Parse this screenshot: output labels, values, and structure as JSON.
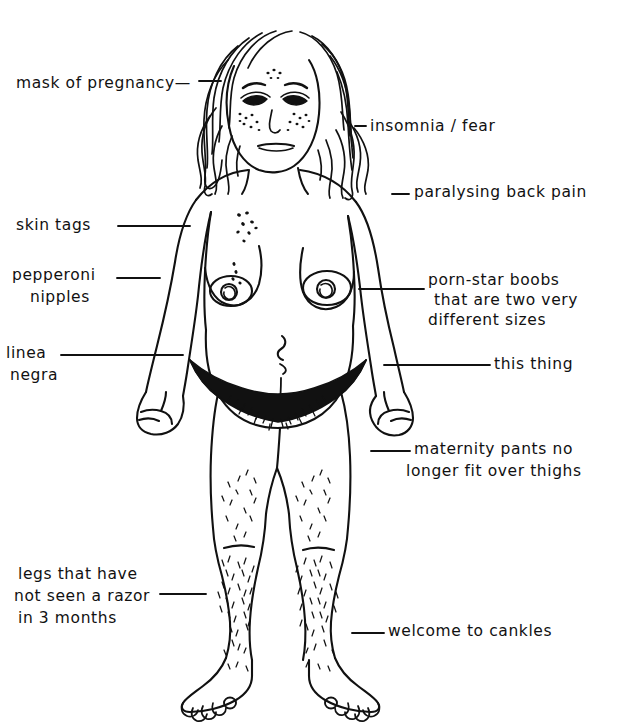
{
  "figure": {
    "style": "black ink line drawing on white background",
    "background_color": "#ffffff",
    "ink_color": "#111111"
  },
  "labels": {
    "mask_of_pregnancy": "mask of pregnancy—",
    "skin_tags": "skin tags",
    "pepperoni_nipples_line1": "pepperoni",
    "pepperoni_nipples_line2": "nipples",
    "linea_negra_line1": "linea",
    "linea_negra_line2": "negra",
    "legs_razor_line1": "legs that have",
    "legs_razor_line2": "not seen a razor",
    "legs_razor_line3": "in 3 months",
    "insomnia_fear": "insomnia / fear",
    "paralysing_back_pain": "paralysing back pain",
    "porn_star_boobs_line1": "porn-star boobs",
    "porn_star_boobs_line2": "that are two very",
    "porn_star_boobs_line3": "different sizes",
    "this_thing": "this thing",
    "maternity_pants_line1": "maternity pants no",
    "maternity_pants_line2": "longer fit over thighs",
    "welcome_to_cankles": "welcome to cankles"
  },
  "body_parts": {
    "head": "head with long wavy hair",
    "face": "face with freckles and shaded eyes",
    "breasts": "two breasts of different sizes with areolas",
    "belly": "pregnant belly with navel and linea negra",
    "bikini": "black bikini bottom",
    "legs": "legs with stubble",
    "feet": "bare feet with toes"
  }
}
